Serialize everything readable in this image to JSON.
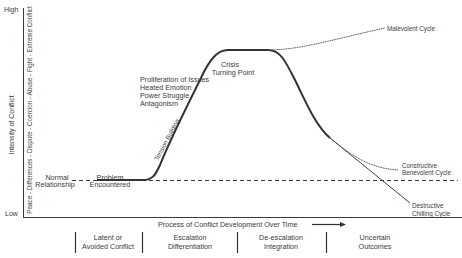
{
  "diagram": {
    "y_axis": {
      "high_label": "High",
      "low_label": "Low",
      "title": "Intensity of Conflict",
      "scale": "Peace - Differences - Dispute - Coercion - Abuse - Fight - Extreme Conflict"
    },
    "x_axis": {
      "title": "Process of Conflict Development Over Time"
    },
    "curve_labels": {
      "normal_1": "Normal",
      "normal_2": "Relationship",
      "problem_1": "Problem",
      "problem_2": "Encountered",
      "tension": "Tension Building",
      "issues_1": "Proliferation of Issues",
      "issues_2": "Heated Emotion",
      "issues_3": "Power Struggle",
      "issues_4": "Antagonism",
      "crisis_1": "Crisis",
      "crisis_2": "Turning Point",
      "malevolent": "Malevolent Cycle",
      "constructive_1": "Constructive",
      "constructive_2": "Benevolent Cycle",
      "destructive_1": "Destructive",
      "destructive_2": "Chilling Cycle"
    },
    "phases": [
      {
        "line1": "Latent or",
        "line2": "Avoided Conflict"
      },
      {
        "line1": "Escalation",
        "line2": "Differentiation"
      },
      {
        "line1": "De-escalation",
        "line2": "Integration"
      },
      {
        "line1": "Uncertain",
        "line2": "Outcomes"
      }
    ],
    "colors": {
      "line": "#3a3a3a",
      "text": "#3a3a3a"
    }
  }
}
